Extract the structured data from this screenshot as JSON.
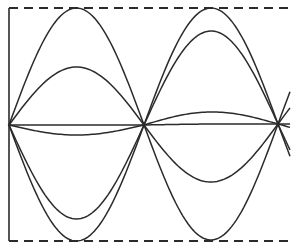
{
  "diagram": {
    "title": "",
    "stroke_color": "#2b2b2b",
    "background": "#ffffff",
    "frame": {
      "left_x": 9,
      "top_y": 8,
      "bottom_y": 241,
      "right_x": 290,
      "top_dashed": true,
      "bottom_dashed": true
    },
    "axis_y": 125,
    "nodes": [
      {
        "x": 9,
        "y": 125
      },
      {
        "x": 144,
        "y": 125
      },
      {
        "x": 278,
        "y": 124
      }
    ],
    "loops": [
      {
        "x_start": 9,
        "x_end": 144,
        "curves": [
          {
            "extreme_y": 8
          },
          {
            "extreme_y": 67
          },
          {
            "extreme_y": 125
          },
          {
            "extreme_y": 135
          },
          {
            "extreme_y": 219
          },
          {
            "extreme_y": 241
          }
        ]
      },
      {
        "x_start": 144,
        "x_end": 278,
        "curves": [
          {
            "extreme_y": 8
          },
          {
            "extreme_y": 31
          },
          {
            "extreme_y": 112
          },
          {
            "extreme_y": 124
          },
          {
            "extreme_y": 182
          },
          {
            "extreme_y": 240
          }
        ]
      }
    ],
    "overshoot": 12
  }
}
